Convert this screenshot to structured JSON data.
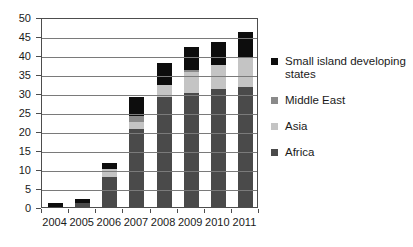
{
  "chart_data": {
    "type": "bar",
    "subtype": "stacked-bar",
    "title": "",
    "xlabel": "",
    "ylabel": "",
    "categories": [
      "2004",
      "2005",
      "2006",
      "2007",
      "2008",
      "2009",
      "2010",
      "2011"
    ],
    "ylim": [
      0,
      50
    ],
    "ytick_step": 5,
    "yticks": [
      "0",
      "5",
      "10",
      "15",
      "20",
      "25",
      "30",
      "35",
      "40",
      "45",
      "50"
    ],
    "grid": true,
    "grid_axis": "y",
    "legend_position": "right",
    "stack_order_bottom_to_top": [
      "Africa",
      "Asia",
      "Middle East",
      "Small island developing states"
    ],
    "series": [
      {
        "name": "Africa",
        "color": "#4a4a4a",
        "values": [
          0,
          1,
          8,
          20.5,
          29,
          30,
          31,
          31.5
        ]
      },
      {
        "name": "Asia",
        "color": "#c4c4c4",
        "values": [
          0,
          0,
          2,
          2,
          3,
          5.5,
          6.5,
          8
        ]
      },
      {
        "name": "Middle East",
        "color": "#8a8a8a",
        "values": [
          0,
          0,
          0,
          1.5,
          0,
          0.5,
          0,
          0
        ]
      },
      {
        "name": "Small island developing states",
        "color": "#0d0d0d",
        "values": [
          1,
          1,
          1.5,
          5,
          6,
          6,
          6,
          6.5
        ]
      }
    ],
    "totals": [
      1,
      2,
      11.5,
      29,
      38,
      42,
      43.5,
      46
    ]
  },
  "legend": {
    "items": [
      {
        "label": "Small island developing states",
        "color": "#0d0d0d"
      },
      {
        "label": "Middle East",
        "color": "#8a8a8a"
      },
      {
        "label": "Asia",
        "color": "#c4c4c4"
      },
      {
        "label": "Africa",
        "color": "#4a4a4a"
      }
    ]
  }
}
